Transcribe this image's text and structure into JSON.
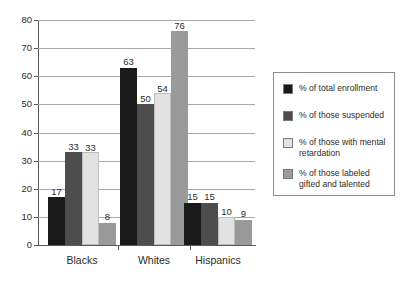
{
  "chart_data": {
    "type": "bar",
    "title": "",
    "xlabel": "",
    "ylabel": "",
    "ylim": [
      0,
      80
    ],
    "ytick_step": 10,
    "yticks": [
      0,
      10,
      20,
      30,
      40,
      50,
      60,
      70,
      80
    ],
    "grid": true,
    "legend_position": "right",
    "categories": [
      "Blacks",
      "Whites",
      "Hispanics"
    ],
    "series": [
      {
        "name": "% of total enrollment",
        "color": "#1a1a1a",
        "values": [
          17,
          63,
          15
        ]
      },
      {
        "name": "% of those suspended",
        "color": "#4d4d4d",
        "values": [
          33,
          50,
          15
        ]
      },
      {
        "name": "% of those with mental retardation",
        "color": "#e2e2e2",
        "values": [
          33,
          54,
          10
        ]
      },
      {
        "name": "% of those labeled gifted and talented",
        "color": "#9a9a9a",
        "values": [
          8,
          76,
          9
        ]
      }
    ]
  },
  "legend": {
    "entries": [
      {
        "label": "% of total enrollment",
        "color": "#1a1a1a"
      },
      {
        "label": "% of those suspended",
        "color": "#4d4d4d"
      },
      {
        "label": "% of those with mental retardation",
        "color": "#e2e2e2"
      },
      {
        "label": "% of those labeled gifted and talented",
        "color": "#9a9a9a"
      }
    ]
  },
  "axis": {
    "y_tick_labels": [
      "0",
      "10",
      "20",
      "30",
      "40",
      "50",
      "60",
      "70",
      "80"
    ],
    "x_tick_labels": [
      "Blacks",
      "Whites",
      "Hispanics"
    ]
  },
  "value_labels": {
    "Blacks": [
      "17",
      "33",
      "33",
      "8"
    ],
    "Whites": [
      "63",
      "50",
      "54",
      "76"
    ],
    "Hispanics": [
      "15",
      "15",
      "10",
      "9"
    ]
  }
}
